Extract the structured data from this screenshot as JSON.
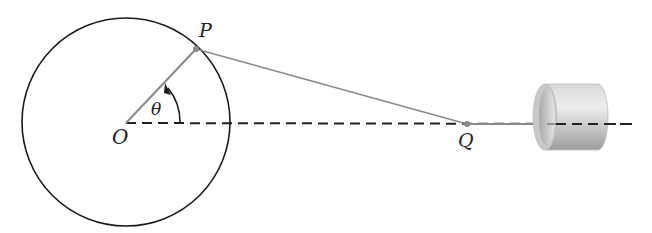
{
  "diagram": {
    "labels": {
      "center": "O",
      "crank_point": "P",
      "slider_point": "Q",
      "angle": "θ"
    },
    "colors": {
      "circle": "#1a1a1a",
      "rod": "#8a8a8a",
      "dashed_axis": "#222222",
      "cylinder_light": "#e0e0e0",
      "cylinder_dark": "#9a9a9a"
    },
    "geometry": {
      "circle_center": [
        126,
        122
      ],
      "circle_radius": 104,
      "P": [
        196,
        48
      ],
      "Q": [
        467,
        124
      ],
      "cylinder": {
        "x": 533,
        "y": 84,
        "w": 70,
        "h": 66
      }
    }
  }
}
